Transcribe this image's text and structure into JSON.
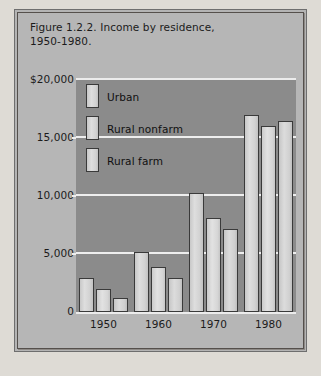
{
  "figure": {
    "title": "Figure 1.2.2. Income by residence,\n1950-1980.",
    "panel_color": "#b6b6b6",
    "plot_color": "#8b8b8b",
    "bar_color": "#d6d6d6",
    "grid_color": "#eeeeee",
    "border_color": "#55504c"
  },
  "chart_data": {
    "type": "bar",
    "title": "Figure 1.2.2. Income by residence, 1950-1980.",
    "xlabel": "",
    "ylabel": "",
    "categories": [
      "1950",
      "1960",
      "1970",
      "1980"
    ],
    "series": [
      {
        "name": "Urban",
        "values": [
          2900,
          5200,
          10300,
          17000
        ]
      },
      {
        "name": "Rural nonfarm",
        "values": [
          1950,
          3900,
          8100,
          16000
        ]
      },
      {
        "name": "Rural farm",
        "values": [
          1250,
          2900,
          7150,
          16500
        ]
      }
    ],
    "ylim": [
      0,
      20000
    ],
    "ytick_values": [
      20000,
      15000,
      10000,
      5000,
      0
    ],
    "ytick_labels": [
      "$20,000",
      "15,000",
      "10,000",
      "5,000",
      "0"
    ],
    "grid": true,
    "grid_axis": "y",
    "legend_position": "upper-left-inside",
    "legend_entries": [
      "Urban",
      "Rural nonfarm",
      "Rural farm"
    ]
  }
}
